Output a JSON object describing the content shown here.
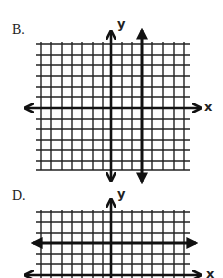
{
  "graphs": [
    {
      "label": "B.",
      "y_axis_label": "y",
      "x_axis_label": "x",
      "description": "Coordinate grid with a vertical line (arrowheads both ends) to the right of the y-axis",
      "grid": {
        "columns": 14,
        "rows": 12
      },
      "highlighted_line": {
        "type": "vertical",
        "offset_units": 3
      }
    },
    {
      "label": "D.",
      "y_axis_label": "y",
      "x_axis_label": "x",
      "description": "Coordinate grid with a horizontal line (arrowheads both ends) above the x-axis",
      "grid": {
        "columns": 14,
        "rows": 6
      },
      "highlighted_line": {
        "type": "horizontal",
        "offset_units": 3
      }
    }
  ]
}
